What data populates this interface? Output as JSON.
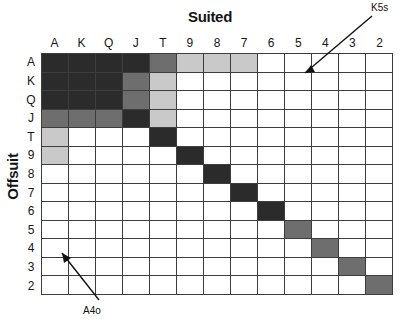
{
  "chart_data": {
    "type": "heatmap",
    "title": "Suited",
    "xlabel": "Suited",
    "ylabel": "Offsuit",
    "grid": true,
    "legend_position": "none",
    "categories": [
      "A",
      "K",
      "Q",
      "J",
      "T",
      "9",
      "8",
      "7",
      "6",
      "5",
      "4",
      "3",
      "2"
    ],
    "col_labels": [
      "A",
      "K",
      "Q",
      "J",
      "T",
      "9",
      "8",
      "7",
      "6",
      "5",
      "4",
      "3",
      "2"
    ],
    "row_labels": [
      "A",
      "K",
      "Q",
      "J",
      "T",
      "9",
      "8",
      "7",
      "6",
      "5",
      "4",
      "3",
      "2"
    ],
    "shade_levels": {
      "0": "#ffffff",
      "1": "#c9c9c9",
      "2": "#8f8f8f",
      "3": "#6e6e6e",
      "4": "#2b2b2b"
    },
    "values": [
      [
        4,
        4,
        4,
        4,
        3,
        1,
        1,
        1,
        0,
        0,
        0,
        0,
        0
      ],
      [
        4,
        4,
        4,
        3,
        1,
        0,
        0,
        0,
        0,
        0,
        0,
        0,
        0
      ],
      [
        4,
        4,
        4,
        3,
        1,
        0,
        0,
        0,
        0,
        0,
        0,
        0,
        0
      ],
      [
        3,
        3,
        3,
        4,
        1,
        0,
        0,
        0,
        0,
        0,
        0,
        0,
        0
      ],
      [
        1,
        0,
        0,
        0,
        4,
        0,
        0,
        0,
        0,
        0,
        0,
        0,
        0
      ],
      [
        1,
        0,
        0,
        0,
        0,
        4,
        0,
        0,
        0,
        0,
        0,
        0,
        0
      ],
      [
        0,
        0,
        0,
        0,
        0,
        0,
        4,
        0,
        0,
        0,
        0,
        0,
        0
      ],
      [
        0,
        0,
        0,
        0,
        0,
        0,
        0,
        4,
        0,
        0,
        0,
        0,
        0
      ],
      [
        0,
        0,
        0,
        0,
        0,
        0,
        0,
        0,
        4,
        0,
        0,
        0,
        0
      ],
      [
        0,
        0,
        0,
        0,
        0,
        0,
        0,
        0,
        0,
        3,
        0,
        0,
        0
      ],
      [
        0,
        0,
        0,
        0,
        0,
        0,
        0,
        0,
        0,
        0,
        3,
        0,
        0
      ],
      [
        0,
        0,
        0,
        0,
        0,
        0,
        0,
        0,
        0,
        0,
        0,
        3,
        0
      ],
      [
        0,
        0,
        0,
        0,
        0,
        0,
        0,
        0,
        0,
        0,
        0,
        0,
        3
      ]
    ],
    "annotations": [
      {
        "text": "K5s",
        "target_cell": "row K, column 5",
        "arrow": "down-left"
      },
      {
        "text": "A4o",
        "target_cell": "row 4, column A",
        "arrow": "up-left"
      }
    ]
  },
  "titles": {
    "suited": "Suited",
    "offsuit": "Offsuit"
  },
  "annotations": {
    "k5s": "K5s",
    "a4o": "A4o"
  }
}
